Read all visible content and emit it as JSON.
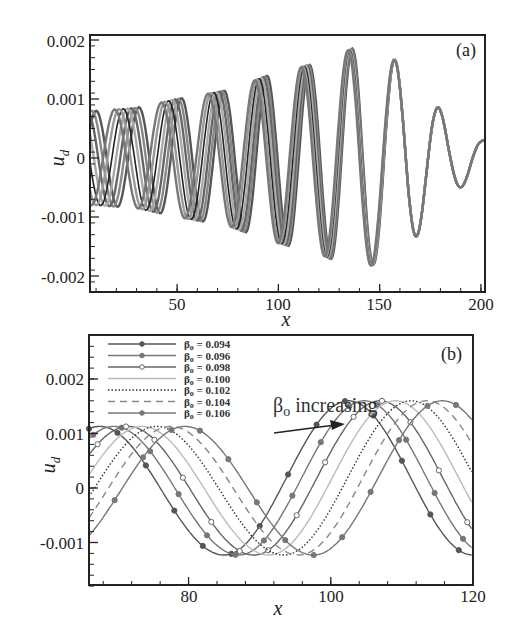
{
  "chart_data": [
    {
      "id": "a",
      "type": "line",
      "panel_label": "(a)",
      "xlabel": "x",
      "ylabel": "u_d",
      "xlim": [
        7,
        202
      ],
      "ylim": [
        -0.0022,
        0.0021
      ],
      "xticks": [
        "50",
        "100",
        "150",
        "200"
      ],
      "yticks": [
        "0.002",
        "0.001",
        "0",
        "-0.001",
        "-0.002"
      ],
      "description": "Seven overlapping sinusoidal traces (one per beta_o) growing in amplitude from ~0.0008 near x=10 to ~0.0019 near x=140, then decaying to ~0.0003 at x=200; traces spread apart at small x and converge at large x.",
      "envelope": {
        "x": [
          10,
          30,
          50,
          75,
          95,
          118,
          140,
          162,
          185,
          200
        ],
        "amplitude": [
          0.0008,
          0.00085,
          0.001,
          0.00115,
          0.0014,
          0.0016,
          0.0019,
          0.0016,
          0.0006,
          0.0003
        ]
      },
      "wavelength": 22,
      "series_count": 7
    },
    {
      "id": "b",
      "type": "line",
      "panel_label": "(b)",
      "xlabel": "x",
      "ylabel": "u_d",
      "xlim": [
        66,
        120
      ],
      "ylim": [
        -0.0018,
        0.0028
      ],
      "xticks": [
        "80",
        "100",
        "120"
      ],
      "yticks": [
        "0.002",
        "0.001",
        "0",
        "-0.001"
      ],
      "annotation": "β_o increasing",
      "legend_position": "upper left",
      "series": [
        {
          "name": "β_o = 0.094",
          "beta": "0.094",
          "style": "solid-marker-square",
          "color": "#555555",
          "first_peak_x": 67.5
        },
        {
          "name": "β_o = 0.096",
          "beta": "0.096",
          "style": "solid-marker-triangle",
          "color": "#777777",
          "first_peak_x": 69.5
        },
        {
          "name": "β_o = 0.098",
          "beta": "0.098",
          "style": "solid-marker-circle",
          "color": "#666666",
          "first_peak_x": 71.5
        },
        {
          "name": "β_o = 0.100",
          "beta": "0.100",
          "style": "solid",
          "color": "#bbbbbb",
          "first_peak_x": 73.5
        },
        {
          "name": "β_o = 0.102",
          "beta": "0.102",
          "style": "dotted",
          "color": "#333333",
          "first_peak_x": 75.5
        },
        {
          "name": "β_o = 0.104",
          "beta": "0.104",
          "style": "dashed",
          "color": "#888888",
          "first_peak_x": 77.5
        },
        {
          "name": "β_o = 0.106",
          "beta": "0.106",
          "style": "solid-marker-diamond",
          "color": "#777777",
          "first_peak_x": 79.5
        }
      ],
      "amplitude_first_peak": 0.00113,
      "amplitude_trough": -0.00123,
      "amplitude_second_peak": 0.0016,
      "wavelength": 40
    }
  ]
}
